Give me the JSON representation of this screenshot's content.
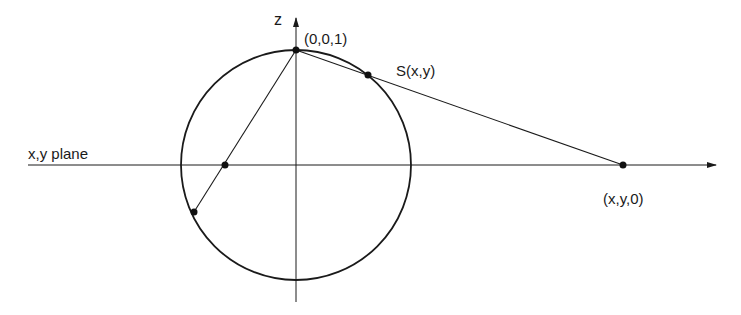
{
  "diagram": {
    "colors": {
      "stroke": "#1a1a1a",
      "background": "#ffffff"
    },
    "labels": {
      "z_axis": "z",
      "north_pole": "(0,0,1)",
      "sphere_point": "S(x,y)",
      "plane": "x,y plane",
      "plane_point": "(x,y,0)"
    },
    "geometry": {
      "circle": {
        "cx": 296,
        "cy": 165,
        "r": 115
      },
      "z_axis": {
        "x": 296,
        "y_top": 18,
        "y_bottom": 302
      },
      "plane_axis": {
        "y": 165,
        "x_left": 28,
        "x_right": 716
      },
      "points": {
        "north_pole": [
          296,
          50
        ],
        "sphere_point": [
          368,
          75
        ],
        "plane_point": [
          623,
          165
        ],
        "inner_plane_point": [
          225,
          165
        ],
        "lower_sphere_point": [
          194,
          212
        ]
      }
    }
  }
}
